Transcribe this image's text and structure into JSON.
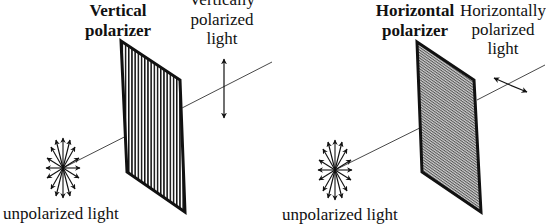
{
  "diagram": {
    "colors": {
      "ink": "#111111",
      "ray": "#333333",
      "background": "#ffffff",
      "hatch_fill": "#9a9a9a"
    },
    "panels": [
      {
        "id": "vertical",
        "polarizer_label_line1": "Vertical",
        "polarizer_label_line2": "polarizer",
        "output_label_line1": "Vertically",
        "output_label_line2": "polarized",
        "output_label_line3": "light",
        "input_label": "unpolarized light",
        "polarizer_pattern": "vertical-lines",
        "output_arrow": "vertical double arrow"
      },
      {
        "id": "horizontal",
        "polarizer_label_line1": "Horizontal",
        "polarizer_label_line2": "polarizer",
        "output_label_line1": "Horizontally",
        "output_label_line2": "polarized",
        "output_label_line3": "light",
        "input_label": "unpolarized light",
        "polarizer_pattern": "fine-diagonal-hatch",
        "output_arrow": "horizontal (oblique) double arrow"
      }
    ]
  }
}
